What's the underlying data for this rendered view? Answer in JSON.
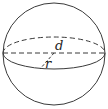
{
  "diagram": {
    "shape": "sphere",
    "labels": {
      "diameter": "d",
      "radius": "r"
    },
    "colors": {
      "stroke": "#3a3a3a",
      "background": "#ffffff",
      "label": "#222222"
    }
  }
}
